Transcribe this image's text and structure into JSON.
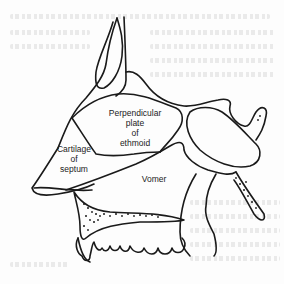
{
  "figure": {
    "colors": {
      "line": "#1a1a1a",
      "background": "#fdfdfd",
      "label_text": "#222222"
    },
    "labels": {
      "perpendicular_plate": {
        "line1": "Perpendicular",
        "line2": "plate",
        "line3": "of",
        "line4": "ethmoid"
      },
      "cartilage": {
        "line1": "Cartilage",
        "line2": "of",
        "line3": "septum"
      },
      "vomer": {
        "line1": "Vomer"
      }
    }
  }
}
